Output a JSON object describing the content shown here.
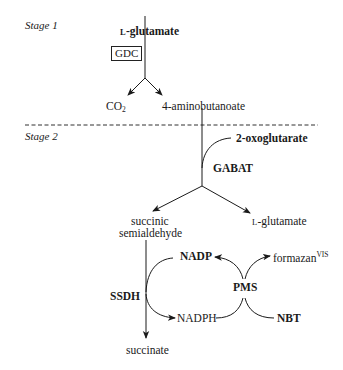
{
  "stages": {
    "stage1": "Stage 1",
    "stage2": "Stage 2"
  },
  "stage1": {
    "substrate": {
      "prefix": "L",
      "name": "-glutamate"
    },
    "enzyme": "GDC",
    "products": {
      "left": {
        "base": "CO",
        "subscript": "2"
      },
      "right": "4-aminobutanoate"
    }
  },
  "stage2": {
    "cosubstrate": "2-oxoglutarate",
    "enzyme": "GABAT",
    "products": {
      "left_line1": "succinic",
      "left_line2": "semialdehyde",
      "right": {
        "prefix": "L",
        "name": "-glutamate"
      }
    }
  },
  "stage3": {
    "enzyme": "SSDH",
    "cofactor_oxidized": "NADP",
    "cofactor_reduced": "NADPH",
    "mediator": "PMS",
    "dye": "NBT",
    "dye_product": {
      "base": "formazan",
      "superscript": "VIS"
    },
    "final_product": "succinate"
  }
}
